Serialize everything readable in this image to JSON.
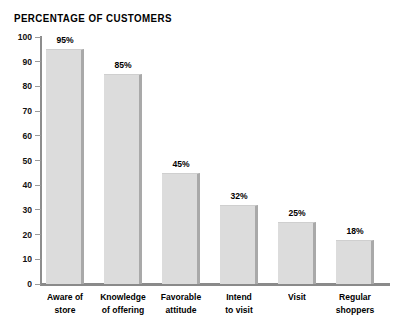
{
  "chart_data": {
    "type": "bar",
    "title": "PERCENTAGE OF CUSTOMERS",
    "xlabel": "",
    "ylabel": "",
    "ylim": [
      0,
      100
    ],
    "grid": false,
    "legend": null,
    "categories": [
      "Aware of store",
      "Knowledge of offering",
      "Favorable attitude",
      "Intend to visit",
      "Visit",
      "Regular shoppers"
    ],
    "category_lines": [
      [
        "Aware of",
        "store"
      ],
      [
        "Knowledge",
        "of offering"
      ],
      [
        "Favorable",
        "attitude"
      ],
      [
        "Intend",
        "to visit"
      ],
      [
        "Visit"
      ],
      [
        "Regular",
        "shoppers"
      ]
    ],
    "values": [
      95,
      85,
      45,
      32,
      25,
      18
    ],
    "value_labels": [
      "95%",
      "85%",
      "45%",
      "32%",
      "25%",
      "18%"
    ],
    "y_ticks": [
      0,
      10,
      20,
      30,
      40,
      50,
      60,
      70,
      80,
      90,
      100
    ],
    "y_tick_labels": [
      "0",
      "10",
      "20",
      "30",
      "40",
      "50",
      "60",
      "70",
      "80",
      "90",
      "100"
    ],
    "colors": {
      "bar_fill": "#dcdcdc",
      "bar_shadow": "#a9a9a9",
      "axis": "#8a8a8a",
      "text": "#000000",
      "background": "#ffffff"
    }
  }
}
